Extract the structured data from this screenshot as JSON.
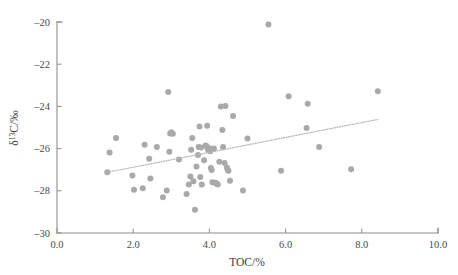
{
  "chart_data": {
    "type": "scatter",
    "title": "",
    "xlabel": "TOC/%",
    "ylabel": "δ¹³C/‰",
    "ylabel_parts": {
      "delta": "δ",
      "superscript": "13",
      "rest": "C/‰"
    },
    "xlim": [
      0.0,
      10.0
    ],
    "ylim": [
      -30,
      -20
    ],
    "grid": false,
    "legend": null,
    "xticks": [
      0.0,
      2.0,
      4.0,
      6.0,
      8.0,
      10.0
    ],
    "xtick_labels": [
      "0.0",
      "2.0",
      "4.0",
      "6.0",
      "8.0",
      "10.0"
    ],
    "yticks": [
      -30,
      -28,
      -26,
      -24,
      -22,
      -20
    ],
    "ytick_labels": [
      "-30",
      "-28",
      "-26",
      "-24",
      "-22",
      "-20"
    ],
    "marker": {
      "shape": "circle",
      "color": "#a9a9a9",
      "size_px": 5.2
    },
    "trendline": {
      "style": "dotted",
      "color": "#b9b9b9",
      "x_start": 1.32,
      "y_start": -27.12,
      "x_end": 8.42,
      "y_end": -24.62
    },
    "points": [
      [
        1.32,
        -27.12
      ],
      [
        1.38,
        -26.18
      ],
      [
        1.55,
        -25.5
      ],
      [
        1.98,
        -27.27
      ],
      [
        2.02,
        -27.95
      ],
      [
        2.25,
        -27.88
      ],
      [
        2.3,
        -25.82
      ],
      [
        2.42,
        -26.48
      ],
      [
        2.45,
        -27.42
      ],
      [
        2.62,
        -25.93
      ],
      [
        2.78,
        -28.3
      ],
      [
        2.88,
        -27.98
      ],
      [
        2.92,
        -23.32
      ],
      [
        2.95,
        -26.15
      ],
      [
        2.97,
        -25.28
      ],
      [
        3.0,
        -25.22
      ],
      [
        3.04,
        -25.3
      ],
      [
        3.2,
        -26.52
      ],
      [
        3.4,
        -28.15
      ],
      [
        3.46,
        -27.7
      ],
      [
        3.5,
        -27.32
      ],
      [
        3.52,
        -26.05
      ],
      [
        3.55,
        -25.5
      ],
      [
        3.58,
        -27.55
      ],
      [
        3.62,
        -28.9
      ],
      [
        3.66,
        -26.85
      ],
      [
        3.7,
        -26.3
      ],
      [
        3.72,
        -25.92
      ],
      [
        3.74,
        -24.95
      ],
      [
        3.76,
        -27.35
      ],
      [
        3.78,
        -25.95
      ],
      [
        3.8,
        -27.7
      ],
      [
        3.86,
        -26.55
      ],
      [
        3.9,
        -25.85
      ],
      [
        3.92,
        -25.88
      ],
      [
        3.94,
        -24.92
      ],
      [
        3.96,
        -26.02
      ],
      [
        3.98,
        -26.08
      ],
      [
        4.0,
        -25.98
      ],
      [
        4.02,
        -26.12
      ],
      [
        4.04,
        -26.92
      ],
      [
        4.06,
        -27.02
      ],
      [
        4.08,
        -27.6
      ],
      [
        4.12,
        -26.0
      ],
      [
        4.16,
        -27.62
      ],
      [
        4.18,
        -27.65
      ],
      [
        4.2,
        -27.68
      ],
      [
        4.22,
        -27.7
      ],
      [
        4.26,
        -26.62
      ],
      [
        4.3,
        -24.0
      ],
      [
        4.34,
        -25.12
      ],
      [
        4.36,
        -25.92
      ],
      [
        4.4,
        -26.68
      ],
      [
        4.42,
        -23.98
      ],
      [
        4.46,
        -26.9
      ],
      [
        4.48,
        -27.0
      ],
      [
        4.5,
        -27.05
      ],
      [
        4.54,
        -27.52
      ],
      [
        4.62,
        -24.45
      ],
      [
        4.88,
        -27.98
      ],
      [
        5.0,
        -25.52
      ],
      [
        5.55,
        -20.12
      ],
      [
        5.88,
        -27.05
      ],
      [
        6.08,
        -23.52
      ],
      [
        6.55,
        -25.02
      ],
      [
        6.58,
        -23.88
      ],
      [
        6.88,
        -25.92
      ],
      [
        7.72,
        -26.98
      ],
      [
        8.42,
        -23.28
      ]
    ]
  }
}
